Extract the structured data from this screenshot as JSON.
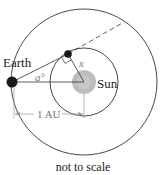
{
  "diagram": {
    "labels": {
      "earth": "Earth",
      "sun": "Sun",
      "angle": "a°",
      "distance_x": "x",
      "au": "1 AU",
      "caption": "not to scale"
    },
    "colors": {
      "line": "#333333",
      "earth": "#1a1a1a",
      "planet": "#1a1a1a",
      "sun": "#bdbdbd",
      "measure": "#888888"
    }
  }
}
